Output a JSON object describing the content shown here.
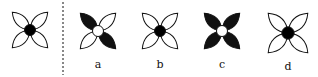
{
  "figure": {
    "reference": {
      "center": [
        30,
        30
      ],
      "size": 25,
      "petals": [
        "white",
        "white",
        "white",
        "white"
      ],
      "center_fill": "#000000"
    },
    "divider": {
      "x": 63,
      "style": "dashed"
    },
    "options": [
      {
        "label": "a",
        "center": [
          98,
          31
        ],
        "size": 25,
        "petals": [
          "black",
          "white",
          "black",
          "white"
        ],
        "center_fill": "#ffffff"
      },
      {
        "label": "b",
        "center": [
          160,
          31
        ],
        "size": 25,
        "petals": [
          "white",
          "white",
          "white",
          "white"
        ],
        "center_fill": "#000000"
      },
      {
        "label": "c",
        "center": [
          222,
          31
        ],
        "size": 25,
        "petals": [
          "black",
          "black",
          "black",
          "black"
        ],
        "center_fill": "#ffffff"
      },
      {
        "label": "d",
        "center": [
          288,
          33
        ],
        "size": 28,
        "petals": [
          "white",
          "white",
          "white",
          "white"
        ],
        "center_fill": "#000000"
      }
    ],
    "colors": {
      "ink": "#111111",
      "paper": "#ffffff"
    }
  }
}
